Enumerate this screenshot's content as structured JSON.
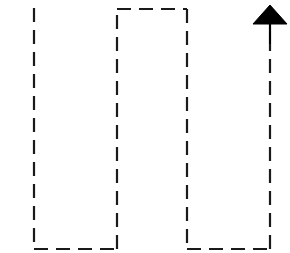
{
  "canvas": {
    "width": 290,
    "height": 253,
    "background_color": "#ffffff",
    "stroke_color": "#1a1a1a",
    "fill_color": "#000000",
    "title": "Dashed outline schematic with upward arrow"
  },
  "style": {
    "stroke_width": 2.2,
    "dash_length": 14,
    "gap_length": 8,
    "dash_pattern": "14 8"
  },
  "figure": {
    "type": "line-drawing",
    "shapes": [
      {
        "name": "left-dashed-vertical",
        "kind": "polyline",
        "stroke": "#1a1a1a",
        "dashed": true,
        "points": [
          [
            34,
            8
          ],
          [
            34,
            249
          ]
        ]
      },
      {
        "name": "left-bottom-dashed-edge",
        "kind": "polyline",
        "stroke": "#1a1a1a",
        "dashed": true,
        "points": [
          [
            34,
            249
          ],
          [
            117,
            249
          ]
        ]
      },
      {
        "name": "inner-left-dashed-vertical",
        "kind": "polyline",
        "stroke": "#1a1a1a",
        "dashed": true,
        "points": [
          [
            117,
            249
          ],
          [
            117,
            9
          ]
        ]
      },
      {
        "name": "top-dashed-horizontal-edge",
        "kind": "polyline",
        "stroke": "#1a1a1a",
        "dashed": true,
        "points": [
          [
            117,
            9
          ],
          [
            187,
            9
          ]
        ]
      },
      {
        "name": "inner-right-dashed-vertical",
        "kind": "polyline",
        "stroke": "#1a1a1a",
        "dashed": true,
        "points": [
          [
            187,
            9
          ],
          [
            187,
            249
          ]
        ]
      },
      {
        "name": "right-bottom-dashed-edge",
        "kind": "polyline",
        "stroke": "#1a1a1a",
        "dashed": true,
        "points": [
          [
            187,
            249
          ],
          [
            270,
            249
          ]
        ]
      },
      {
        "name": "right-dashed-vertical",
        "kind": "polyline",
        "stroke": "#1a1a1a",
        "dashed": true,
        "points": [
          [
            270,
            249
          ],
          [
            270,
            44
          ]
        ]
      },
      {
        "name": "arrow-shaft",
        "kind": "line",
        "stroke": "#000000",
        "dashed": false,
        "points": [
          [
            270,
            44
          ],
          [
            270,
            22
          ]
        ]
      },
      {
        "name": "arrow-head",
        "kind": "triangle",
        "fill": "#000000",
        "apex": [
          270,
          5
        ],
        "base_left": [
          253,
          24
        ],
        "base_right": [
          287,
          24
        ]
      }
    ]
  },
  "arrow": {
    "direction": "up",
    "head_width": 34,
    "head_height": 19,
    "shaft_x": 270,
    "label": ""
  }
}
